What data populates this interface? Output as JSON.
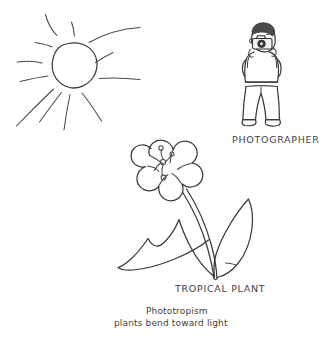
{
  "illustration": {
    "title": "Phototropism hand-drawn sketch",
    "background_color": "#ffffff",
    "ink_color": "#3a3a3a",
    "medium": "pen line drawing"
  },
  "labels": {
    "photographer": "PHOTOGRAPHER",
    "tropical_plant": "TROPICAL PLANT"
  },
  "caption": {
    "term": "Phototropism",
    "description": "plants bend toward light"
  },
  "figures": {
    "sun": {
      "name": "sun",
      "ray_count": 11,
      "position": "upper-left"
    },
    "photographer": {
      "name": "photographer-with-camera",
      "position": "upper-right",
      "holding": "camera"
    },
    "plant": {
      "name": "tropical-flowering-plant",
      "position": "center",
      "petal_count": 5,
      "leaf_count": 2,
      "bends_toward": "sun"
    }
  }
}
